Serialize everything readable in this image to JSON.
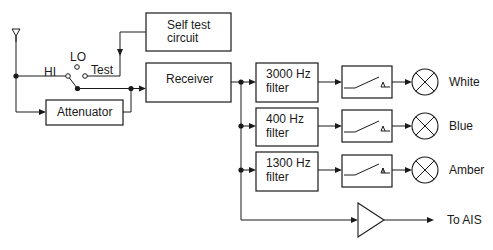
{
  "diagram": {
    "type": "block-diagram",
    "colors": {
      "ink": "#1a1a1a",
      "background": "#ffffff"
    },
    "antenna": {
      "icon": "antenna-icon"
    },
    "switch": {
      "positions": [
        "HI",
        "LO",
        "Test"
      ]
    },
    "blocks": {
      "self_test": {
        "line1": "Self test",
        "line2": "circuit"
      },
      "receiver": {
        "label": "Receiver"
      },
      "attenuator": {
        "label": "Attenuator"
      },
      "filter_3000": {
        "line1": "3000 Hz",
        "line2": "filter"
      },
      "filter_400": {
        "line1": "400 Hz",
        "line2": "filter"
      },
      "filter_1300": {
        "line1": "1300 Hz",
        "line2": "filter"
      }
    },
    "relays": [
      "relay-icon",
      "relay-icon",
      "relay-icon"
    ],
    "lamps": [
      {
        "label": "White"
      },
      {
        "label": "Blue"
      },
      {
        "label": "Amber"
      }
    ],
    "amplifier": {
      "icon": "amplifier-icon",
      "output_label": "To AIS"
    }
  }
}
